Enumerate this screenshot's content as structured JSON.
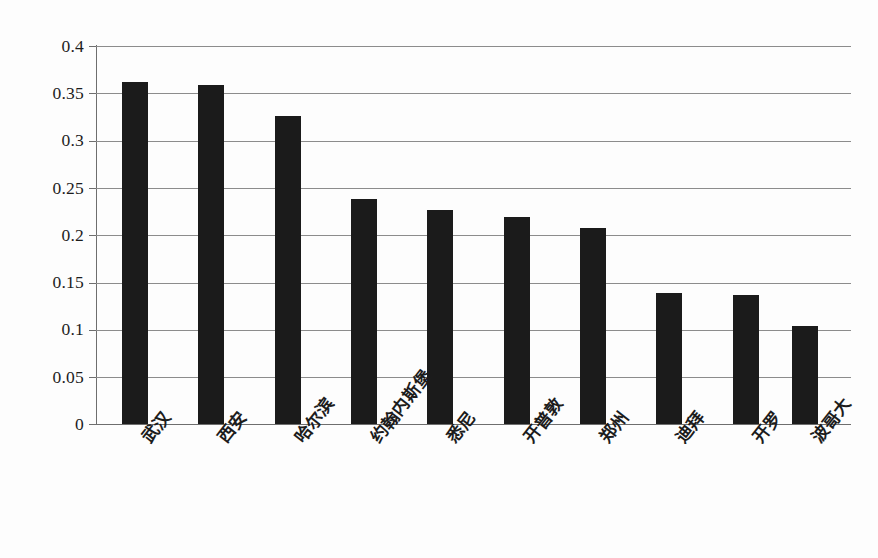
{
  "chart_data": {
    "type": "bar",
    "title": "",
    "subtitle": "",
    "xlabel": "",
    "ylabel": "",
    "ylim": [
      0,
      0.4
    ],
    "ytick_labels": [
      "0.4",
      "0.35",
      "0.3",
      "0.25",
      "0.2",
      "0.15",
      "0.1",
      "0.05",
      "0"
    ],
    "ytick_values": [
      0.4,
      0.35,
      0.3,
      0.25,
      0.2,
      0.15,
      0.1,
      0.05,
      0
    ],
    "grid": "horizontal",
    "legend": "none",
    "annotations": [],
    "categories": [
      "武汉",
      "西安",
      "哈尔滨",
      "约翰内斯堡",
      "悉尼",
      "开普敦",
      "郑州",
      "迪拜",
      "开罗",
      "波哥大"
    ],
    "values": [
      0.362,
      0.359,
      0.326,
      0.238,
      0.226,
      0.219,
      0.207,
      0.139,
      0.137,
      0.104
    ],
    "bar_color": "#1b1b1b",
    "background_color": "#fdfdfd",
    "gridline_color": "#8c8c8c",
    "axis_color": "#6e6e6e"
  }
}
